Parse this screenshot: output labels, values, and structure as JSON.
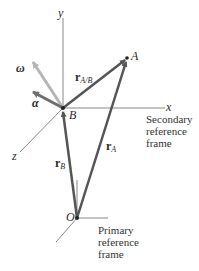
{
  "diagram": {
    "points": {
      "A": {
        "label": "A",
        "x": 127,
        "y": 58
      },
      "B": {
        "label": "B",
        "x": 63,
        "y": 108
      },
      "O": {
        "label": "O",
        "x": 77,
        "y": 218
      }
    },
    "secondary_axes": {
      "x_label": "x",
      "y_label": "y",
      "z_label": "z"
    },
    "vectors": {
      "r_A_B": {
        "main": "r",
        "sub": "A/B"
      },
      "r_B": {
        "main": "r",
        "sub": "B"
      },
      "r_A": {
        "main": "r",
        "sub": "A"
      },
      "omega": {
        "label": "ω"
      },
      "alpha": {
        "label": "α"
      }
    },
    "captions": {
      "secondary": [
        "Secondary",
        "reference",
        "frame"
      ],
      "primary": [
        "Primary",
        "reference",
        "frame"
      ]
    },
    "colors": {
      "vector": "#555555",
      "omega": "#b5b5b5",
      "alpha": "#6e6e6e",
      "axis": "#777777"
    }
  }
}
